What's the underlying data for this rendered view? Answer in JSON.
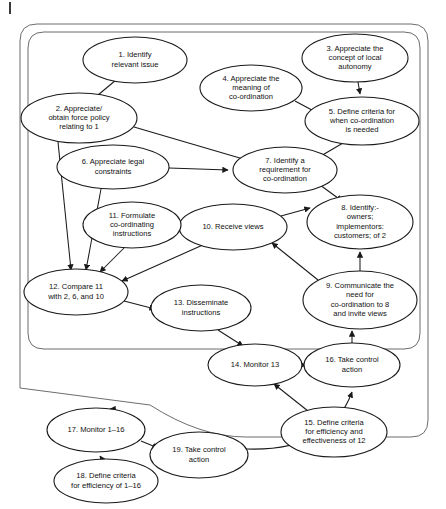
{
  "figure": {
    "kind": "activity-flow-diagram",
    "frame": {
      "outer_label": "outer-rounded-frame",
      "inner_label": "inner-rounded-frame",
      "margin_tick": "page-margin-tick"
    }
  },
  "chart_data": {
    "type": "diagram",
    "title": "",
    "nodes": [
      {
        "id": "n1",
        "number": "1.",
        "lines": [
          "1. Identify",
          "relevant issue"
        ],
        "cx": 135,
        "cy": 60,
        "rx": 52,
        "ry": 23
      },
      {
        "id": "n2",
        "number": "2.",
        "lines": [
          "2. Appreciate/",
          "obtain force policy",
          "relating to 1"
        ],
        "cx": 79,
        "cy": 118,
        "rx": 58,
        "ry": 25
      },
      {
        "id": "n3",
        "number": "3.",
        "lines": [
          "3. Appreciate the",
          "concept of local",
          "autonomy"
        ],
        "cx": 355,
        "cy": 58,
        "rx": 53,
        "ry": 24
      },
      {
        "id": "n4",
        "number": "4.",
        "lines": [
          "4. Appreciate the",
          "meaning of",
          "co-ordination"
        ],
        "cx": 251,
        "cy": 88,
        "rx": 51,
        "ry": 23
      },
      {
        "id": "n5",
        "number": "5.",
        "lines": [
          "5. Define criteria for",
          "when co-ordination",
          "is needed"
        ],
        "cx": 362,
        "cy": 121,
        "rx": 57,
        "ry": 24
      },
      {
        "id": "n6",
        "number": "6.",
        "lines": [
          "6. Appreciate legal",
          "constraints"
        ],
        "cx": 113,
        "cy": 167,
        "rx": 56,
        "ry": 22
      },
      {
        "id": "n7",
        "number": "7.",
        "lines": [
          "7. Identify a",
          "requirement for",
          "co-ordination"
        ],
        "cx": 285,
        "cy": 170,
        "rx": 52,
        "ry": 23
      },
      {
        "id": "n8",
        "number": "8.",
        "lines": [
          "8. Identify:-",
          "owners;",
          "implementors:",
          "customers; of 2"
        ],
        "cx": 360,
        "cy": 222,
        "rx": 53,
        "ry": 27
      },
      {
        "id": "n9",
        "number": "9.",
        "lines": [
          "9. Communicate the",
          "need for",
          "co-ordination to 8",
          "and invite views"
        ],
        "cx": 360,
        "cy": 300,
        "rx": 57,
        "ry": 29
      },
      {
        "id": "n10",
        "number": "10.",
        "lines": [
          "10. Receive views"
        ],
        "cx": 233,
        "cy": 227,
        "rx": 54,
        "ry": 23
      },
      {
        "id": "n11",
        "number": "11.",
        "lines": [
          "11. Formulate",
          "co-ordinating",
          "instructions"
        ],
        "cx": 132,
        "cy": 225,
        "rx": 49,
        "ry": 23
      },
      {
        "id": "n12",
        "number": "12.",
        "lines": [
          "12. Compare 11",
          "with 2, 6, and 10"
        ],
        "cx": 76,
        "cy": 292,
        "rx": 52,
        "ry": 23
      },
      {
        "id": "n13",
        "number": "13.",
        "lines": [
          "13. Disseminate",
          "instructions"
        ],
        "cx": 201,
        "cy": 308,
        "rx": 50,
        "ry": 23
      },
      {
        "id": "n14",
        "number": "14.",
        "lines": [
          "14. Monitor 13"
        ],
        "cx": 255,
        "cy": 365,
        "rx": 47,
        "ry": 21
      },
      {
        "id": "n15",
        "number": "15.",
        "lines": [
          "15. Define criteria",
          "for efficiency and",
          "effectiveness of 12"
        ],
        "cx": 334,
        "cy": 432,
        "rx": 53,
        "ry": 25
      },
      {
        "id": "n16",
        "number": "16.",
        "lines": [
          "16. Take control",
          "action"
        ],
        "cx": 352,
        "cy": 365,
        "rx": 48,
        "ry": 22
      },
      {
        "id": "n17",
        "number": "17.",
        "lines": [
          "17. Monitor 1–16"
        ],
        "cx": 96,
        "cy": 430,
        "rx": 49,
        "ry": 22
      },
      {
        "id": "n18",
        "number": "18.",
        "lines": [
          "18. Define criteria",
          "for efficiency of 1–16"
        ],
        "cx": 106,
        "cy": 481,
        "rx": 52,
        "ry": 22
      },
      {
        "id": "n19",
        "number": "19.",
        "lines": [
          "19. Take control",
          "action"
        ],
        "cx": 199,
        "cy": 455,
        "rx": 49,
        "ry": 23
      }
    ],
    "edges": [
      {
        "from": "n1",
        "to": "n2",
        "label": "edge-1-to-2"
      },
      {
        "from": "n3",
        "to": "n5",
        "label": "edge-3-to-5"
      },
      {
        "from": "n4",
        "to": "n5",
        "label": "edge-4-to-5"
      },
      {
        "from": "n2",
        "to": "n7",
        "label": "edge-2-to-7"
      },
      {
        "from": "n5",
        "to": "n7",
        "label": "edge-5-to-7"
      },
      {
        "from": "n6",
        "to": "n7",
        "label": "edge-6-to-7"
      },
      {
        "from": "n7",
        "to": "n8",
        "label": "edge-7-to-8"
      },
      {
        "from": "n8",
        "to": "n9",
        "label": "edge-8-to-9"
      },
      {
        "from": "n9",
        "to": "n10",
        "label": "edge-9-to-10"
      },
      {
        "from": "n10",
        "to": "n8",
        "label": "edge-10-to-8"
      },
      {
        "from": "n10",
        "to": "n11",
        "label": "edge-10-to-11"
      },
      {
        "from": "n10",
        "to": "n12",
        "label": "edge-10-to-12"
      },
      {
        "from": "n11",
        "to": "n12",
        "label": "edge-11-to-12"
      },
      {
        "from": "n2",
        "to": "n12",
        "label": "edge-2-to-12"
      },
      {
        "from": "n6",
        "to": "n12",
        "label": "edge-6-to-12"
      },
      {
        "from": "n12",
        "to": "n13",
        "label": "edge-12-to-13"
      },
      {
        "from": "n13",
        "to": "n14",
        "label": "edge-13-to-14"
      },
      {
        "from": "n14",
        "to": "n16",
        "label": "edge-14-to-16"
      },
      {
        "from": "n15",
        "to": "n14",
        "label": "edge-15-to-14"
      },
      {
        "from": "n16",
        "to": "n9",
        "label": "edge-16-to-frame-return"
      },
      {
        "from": "n17",
        "to": "n19",
        "label": "edge-17-to-19"
      },
      {
        "from": "n18",
        "to": "n17",
        "label": "edge-18-to-17"
      },
      {
        "from": "n19",
        "to": "n17",
        "label": "edge-19-return-to-17"
      }
    ]
  }
}
